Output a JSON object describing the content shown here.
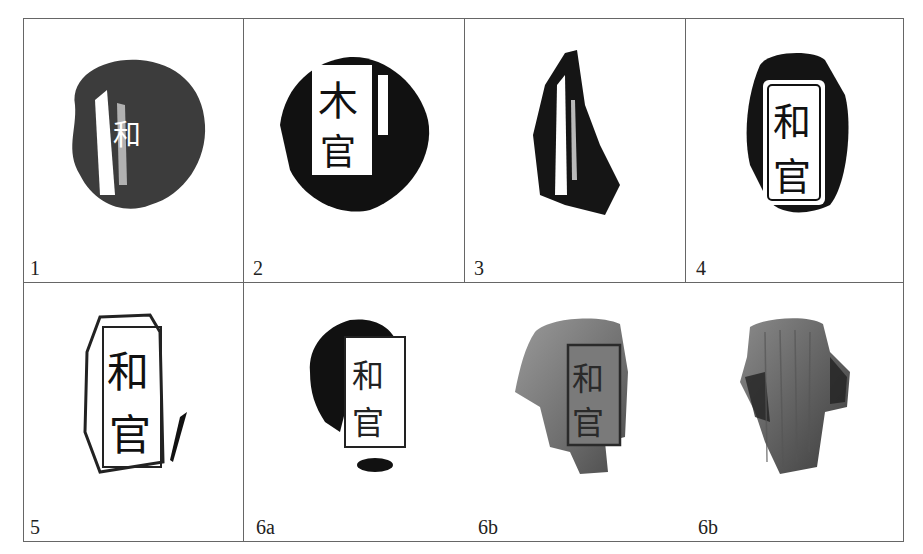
{
  "figure": {
    "type": "plate-grid",
    "rows": 2,
    "cells": [
      {
        "label": "1",
        "kind": "rubbing",
        "characters": "和"
      },
      {
        "label": "2",
        "kind": "rubbing",
        "characters": "官"
      },
      {
        "label": "3",
        "kind": "rubbing",
        "characters": ""
      },
      {
        "label": "4",
        "kind": "rubbing",
        "characters": "和官"
      },
      {
        "label": "5",
        "kind": "rubbing",
        "characters": "和官"
      },
      {
        "label": "6a",
        "kind": "rubbing",
        "characters": "和官"
      },
      {
        "label": "6b",
        "kind": "photograph-front",
        "characters": "和官"
      },
      {
        "label": "6b",
        "kind": "photograph-back",
        "characters": ""
      }
    ]
  },
  "colors": {
    "grid": "#666666",
    "ink": "#111111",
    "clay": "#6e6e6e",
    "paper": "#ffffff"
  }
}
